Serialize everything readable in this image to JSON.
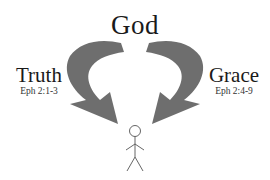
{
  "diagram": {
    "top_label": "God",
    "left": {
      "label": "Truth",
      "reference": "Eph 2:1-3"
    },
    "right": {
      "label": "Grace",
      "reference": "Eph 2:4-9"
    },
    "figure": "stick-figure-person",
    "arrow_color": "#6e6e6e"
  }
}
